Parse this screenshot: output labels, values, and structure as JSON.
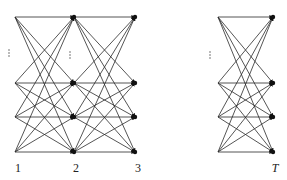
{
  "diagram": {
    "type": "trellis",
    "rows_y": [
      17,
      83,
      117,
      152
    ],
    "groups": [
      {
        "columns_x": [
          15,
          74,
          135
        ]
      },
      {
        "columns_x": [
          218,
          273
        ]
      }
    ],
    "stage_labels": [
      {
        "text": "1",
        "x": 18,
        "y": 172,
        "italic": false
      },
      {
        "text": "2",
        "x": 76,
        "y": 172,
        "italic": false
      },
      {
        "text": "3",
        "x": 138,
        "y": 172,
        "italic": false
      },
      {
        "text": "T",
        "x": 275,
        "y": 172,
        "italic": true
      }
    ],
    "ellipses": [
      {
        "x": 9,
        "y": 53
      },
      {
        "x": 70,
        "y": 55
      },
      {
        "x": 210,
        "y": 55
      }
    ],
    "colors": {
      "edge": "#2a2a2a",
      "node": "#111111",
      "background": "#ffffff"
    }
  }
}
